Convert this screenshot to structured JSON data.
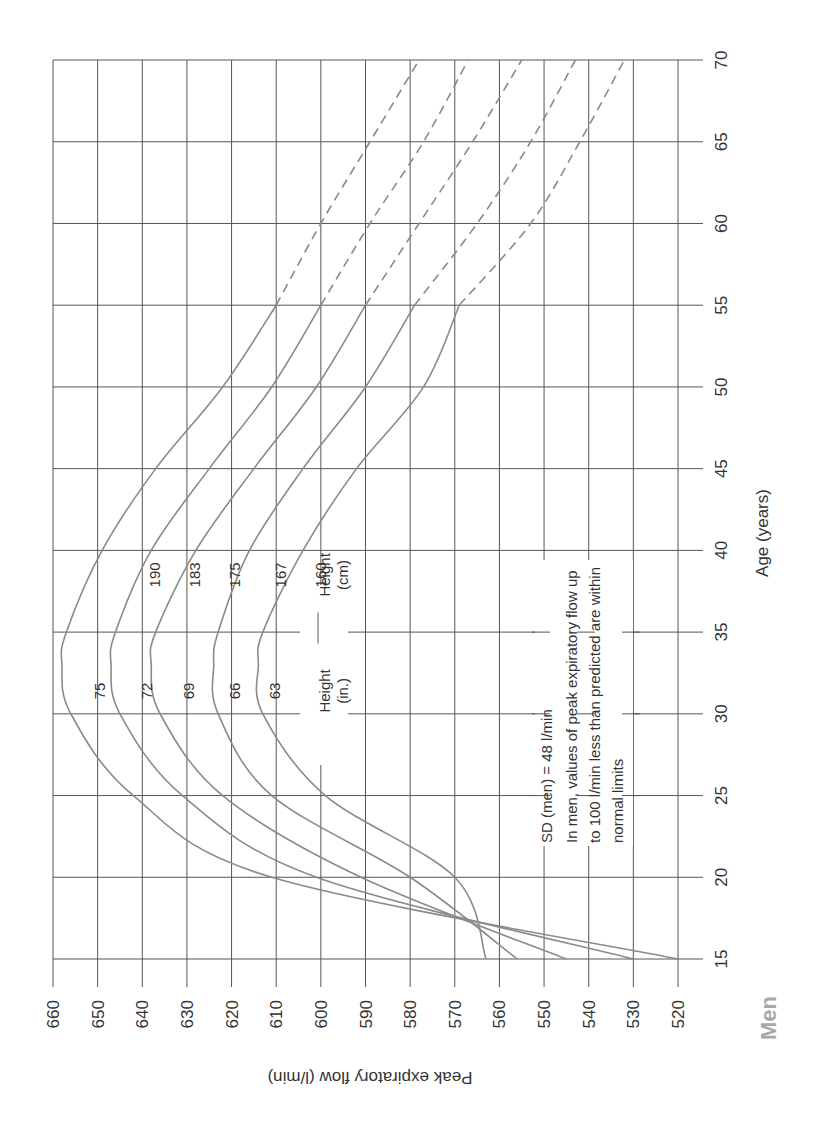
{
  "title": "Men",
  "chart_data": {
    "type": "line",
    "title": "Men",
    "xlabel": "Age (years)",
    "ylabel": "Peak expiratory flow (l/min)",
    "xlim": [
      15,
      70
    ],
    "ylim": [
      520,
      660
    ],
    "x_ticks": [
      15,
      20,
      25,
      30,
      35,
      40,
      45,
      50,
      55,
      60,
      65,
      70
    ],
    "y_ticks": [
      520,
      530,
      540,
      550,
      560,
      570,
      580,
      590,
      600,
      610,
      620,
      630,
      640,
      650,
      660
    ],
    "grid": true,
    "orientation": "rotated 90 degrees counter-clockwise",
    "dashed_from_age": 55,
    "x": [
      15,
      20,
      25,
      30,
      33,
      35,
      40,
      45,
      50,
      55,
      60,
      65,
      70
    ],
    "series": [
      {
        "name": "75 in / 190 cm",
        "height_in": "75",
        "height_cm": "190",
        "values": [
          520,
          611,
          642,
          656,
          658,
          657,
          649,
          637,
          622,
          610,
          600,
          589,
          578
        ]
      },
      {
        "name": "72 in / 183 cm",
        "height_in": "72",
        "height_cm": "183",
        "values": [
          530,
          601,
          631,
          645,
          647,
          646,
          638,
          625,
          611,
          600,
          589,
          577,
          567
        ]
      },
      {
        "name": "69 in / 175 cm",
        "height_in": "69",
        "height_cm": "175",
        "values": [
          545,
          591,
          622,
          636,
          638,
          637,
          628,
          615,
          601,
          590,
          578,
          566,
          555
        ]
      },
      {
        "name": "66 in / 167 cm",
        "height_in": "66",
        "height_cm": "167",
        "values": [
          556,
          580,
          611,
          623,
          624,
          623,
          616,
          604,
          590,
          579,
          565,
          553,
          543
        ]
      },
      {
        "name": "63 in / 160 cm",
        "height_in": "63",
        "height_cm": "160",
        "values": [
          563,
          570,
          599,
          613,
          614,
          613,
          604,
          592,
          577,
          569,
          553,
          542,
          532
        ]
      }
    ],
    "legend": {
      "height_in_label": "Height",
      "height_in_unit": "(in.)",
      "height_cm_label": "Height",
      "height_cm_unit": "(cm)"
    },
    "annotations": [
      "SD (men) = 48 l/min",
      "In men, values of peak expiratory flow up",
      "to 100 l/min less than predicted are within",
      "normal limits"
    ]
  },
  "colors": {
    "grid": "#555555",
    "curve": "#8a8a8a",
    "text": "#333333",
    "title": "#a8a8a8"
  }
}
